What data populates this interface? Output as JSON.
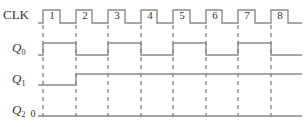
{
  "diagram": {
    "type": "timing",
    "signals": [
      {
        "name": "CLK",
        "label": "CLK",
        "sub": ""
      },
      {
        "name": "Q0",
        "label": "Q",
        "sub": "0"
      },
      {
        "name": "Q1",
        "label": "Q",
        "sub": "1"
      },
      {
        "name": "Q2",
        "label": "Q",
        "sub": "2",
        "initial_value_label": "0"
      }
    ],
    "clock_pulses": [
      "1",
      "2",
      "3",
      "4",
      "5",
      "6",
      "7",
      "8"
    ],
    "waveforms": {
      "CLK": [
        0,
        1,
        0,
        1,
        0,
        1,
        0,
        1,
        0,
        1,
        0,
        1,
        0,
        1,
        0,
        1,
        0
      ],
      "Q0": [
        0,
        1,
        0,
        1,
        0,
        1,
        0,
        1,
        0
      ],
      "Q1": [
        0,
        1,
        1,
        1,
        1,
        1,
        1,
        1,
        1
      ],
      "Q2": [
        0,
        0,
        0,
        0,
        0,
        0,
        0,
        0,
        0
      ]
    },
    "colors": {
      "line": "#8a8a8a",
      "dashed": "#555555",
      "text": "#333333"
    }
  }
}
